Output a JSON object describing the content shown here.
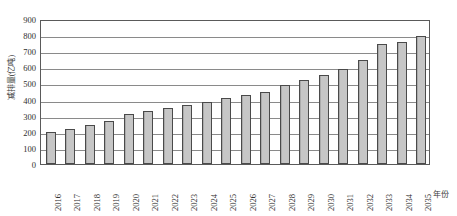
{
  "chart_data": {
    "type": "bar",
    "title": "",
    "xlabel": "年份",
    "ylabel": "减排量(亿吨)",
    "ylim": [
      0,
      900
    ],
    "ytick_step": 100,
    "yticks": [
      0,
      100,
      200,
      300,
      400,
      500,
      600,
      700,
      800,
      900
    ],
    "grid": true,
    "legend": "none",
    "categories": [
      "2016",
      "2017",
      "2018",
      "2019",
      "2020",
      "2021",
      "2022",
      "2023",
      "2024",
      "2025",
      "2026",
      "2027",
      "2028",
      "2029",
      "2030",
      "2031",
      "2032",
      "2033",
      "2034",
      "2035"
    ],
    "values": [
      200,
      220,
      240,
      270,
      310,
      330,
      350,
      367,
      385,
      410,
      427,
      450,
      490,
      522,
      555,
      590,
      648,
      742,
      758,
      795
    ],
    "series": [
      {
        "name": "减排量",
        "values": [
          200,
          220,
          240,
          270,
          310,
          330,
          350,
          367,
          385,
          410,
          427,
          450,
          490,
          522,
          555,
          590,
          648,
          742,
          758,
          795
        ]
      }
    ]
  },
  "style": {
    "bar_fill": "#c6c6c6",
    "bar_border": "#4a4a4a",
    "grid_color": "#8a8a8a",
    "frame_color": "#5a5a5a",
    "text_color": "#2e2e2e"
  }
}
